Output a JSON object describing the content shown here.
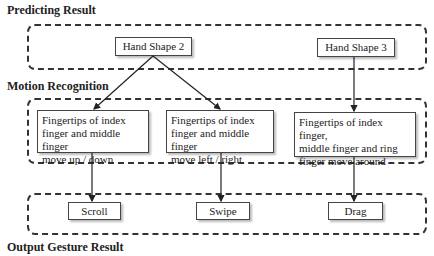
{
  "sections": {
    "predicting": "Predicting Result",
    "motion": "Motion Recognition",
    "output": "Output Gesture Result"
  },
  "hand_shapes": [
    {
      "label": "Hand Shape 2"
    },
    {
      "label": "Hand Shape 3"
    }
  ],
  "motions": [
    {
      "lines": [
        "Fingertips of index",
        "finger and middle finger",
        "move up / down"
      ]
    },
    {
      "lines": [
        "Fingertips of index",
        "finger and middle finger",
        "move left / right"
      ]
    },
    {
      "lines": [
        "Fingertips of index finger,",
        "middle finger and ring",
        "finger move around"
      ]
    }
  ],
  "gestures": [
    {
      "label": "Scroll"
    },
    {
      "label": "Swipe"
    },
    {
      "label": "Drag"
    }
  ],
  "edges": [
    {
      "from": "Hand Shape 2",
      "to": "motion-1"
    },
    {
      "from": "Hand Shape 2",
      "to": "motion-2"
    },
    {
      "from": "Hand Shape 3",
      "to": "motion-3"
    },
    {
      "from": "motion-1",
      "to": "Scroll"
    },
    {
      "from": "motion-2",
      "to": "Swipe"
    },
    {
      "from": "motion-3",
      "to": "Drag"
    }
  ]
}
